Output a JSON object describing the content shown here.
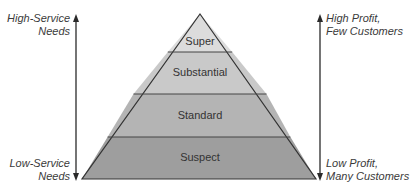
{
  "diagram": {
    "type": "pyramid",
    "tiers": [
      {
        "label": "Super",
        "fill": "#dcdcdc"
      },
      {
        "label": "Substantial",
        "fill": "#c9c9c9"
      },
      {
        "label": "Standard",
        "fill": "#b4b4b4"
      },
      {
        "label": "Suspect",
        "fill": "#9e9e9e"
      }
    ],
    "left_axis": {
      "top_label_line1": "High-Service",
      "top_label_line2": "Needs",
      "bottom_label_line1": "Low-Service",
      "bottom_label_line2": "Needs"
    },
    "right_axis": {
      "top_label_line1": "High Profit,",
      "top_label_line2": "Few Customers",
      "bottom_label_line1": "Low Profit,",
      "bottom_label_line2": "Many Customers"
    },
    "colors": {
      "outline": "#333333",
      "arrow": "#2a2a2a"
    }
  }
}
